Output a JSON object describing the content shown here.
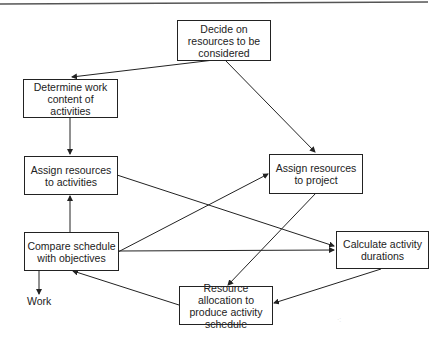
{
  "diagram": {
    "type": "flowchart",
    "title": "",
    "nodes": [
      {
        "id": "decide",
        "text": "Decide on resources to be considered"
      },
      {
        "id": "determine",
        "text": "Determine work content of activities"
      },
      {
        "id": "assign_activities",
        "text": "Assign resources to activities"
      },
      {
        "id": "assign_project",
        "text": "Assign resources to project"
      },
      {
        "id": "compare",
        "text": "Compare schedule with objectives"
      },
      {
        "id": "calculate",
        "text": "Calculate activity durations"
      },
      {
        "id": "allocation",
        "text": "Resource allocation to produce activity schedule"
      }
    ],
    "output_label": "Work",
    "edges": [
      {
        "from": "decide",
        "to": "determine"
      },
      {
        "from": "decide",
        "to": "assign_project"
      },
      {
        "from": "determine",
        "to": "assign_activities"
      },
      {
        "from": "compare",
        "to": "assign_activities"
      },
      {
        "from": "assign_activities",
        "to": "calculate"
      },
      {
        "from": "compare",
        "to": "assign_project"
      },
      {
        "from": "compare",
        "to": "calculate"
      },
      {
        "from": "assign_project",
        "to": "allocation"
      },
      {
        "from": "calculate",
        "to": "allocation"
      },
      {
        "from": "allocation",
        "to": "compare"
      },
      {
        "from": "compare",
        "to": "Work"
      }
    ]
  }
}
